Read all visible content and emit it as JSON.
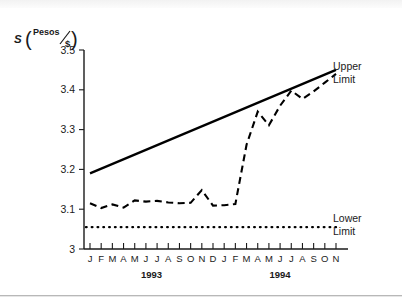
{
  "figure": {
    "background_color": "#ffffff",
    "ink_color": "#1a1a1a"
  },
  "axis_label": {
    "symbol": "S",
    "numerator": "Pesos",
    "denominator": "$",
    "paren_open": "(",
    "paren_close": ")",
    "slash": "/"
  },
  "chart_data": {
    "type": "line",
    "title": "",
    "subtitle": "",
    "xlabel": "",
    "ylabel": "S (Pesos/$)",
    "ylim": [
      3.0,
      3.5
    ],
    "yticks": [
      3.0,
      3.1,
      3.2,
      3.3,
      3.4,
      3.5
    ],
    "ytick_labels": [
      "3",
      "3.1",
      "3.2",
      "3.3",
      "3.4",
      "3.5"
    ],
    "grid": false,
    "legend_position": "inline-right-annotations",
    "x": [
      "1993-01",
      "1993-02",
      "1993-03",
      "1993-04",
      "1993-05",
      "1993-06",
      "1993-07",
      "1993-08",
      "1993-09",
      "1993-10",
      "1993-11",
      "1993-12",
      "1994-01",
      "1994-02",
      "1994-03",
      "1994-04",
      "1994-05",
      "1994-06",
      "1994-07",
      "1994-08",
      "1994-09",
      "1994-10",
      "1994-11"
    ],
    "xtick_labels": [
      "J",
      "F",
      "M",
      "A",
      "M",
      "J",
      "J",
      "A",
      "S",
      "O",
      "N",
      "D",
      "J",
      "F",
      "M",
      "A",
      "M",
      "J",
      "J",
      "A",
      "S",
      "O",
      "N"
    ],
    "year_groups": [
      {
        "label": "1993",
        "start_index": 0,
        "end_index": 11
      },
      {
        "label": "1994",
        "start_index": 12,
        "end_index": 22
      }
    ],
    "series": [
      {
        "name": "Exchange Rate",
        "style": "dashed",
        "color": "#000000",
        "values": [
          3.115,
          3.103,
          3.112,
          3.104,
          3.122,
          3.119,
          3.121,
          3.117,
          3.115,
          3.116,
          3.148,
          3.109,
          3.11,
          3.113,
          3.262,
          3.345,
          3.311,
          3.36,
          3.398,
          3.377,
          3.396,
          3.418,
          3.44
        ]
      },
      {
        "name": "Upper Limit",
        "style": "solid",
        "color": "#000000",
        "values": [
          3.19,
          3.202,
          3.214,
          3.226,
          3.238,
          3.249,
          3.261,
          3.273,
          3.285,
          3.297,
          3.308,
          3.32,
          3.332,
          3.344,
          3.356,
          3.367,
          3.379,
          3.391,
          3.403,
          3.415,
          3.426,
          3.438,
          3.45
        ]
      },
      {
        "name": "Lower Limit",
        "style": "dotted",
        "color": "#000000",
        "values": [
          3.055,
          3.055,
          3.055,
          3.055,
          3.055,
          3.055,
          3.055,
          3.055,
          3.055,
          3.055,
          3.055,
          3.055,
          3.055,
          3.055,
          3.055,
          3.055,
          3.055,
          3.055,
          3.055,
          3.055,
          3.055,
          3.055,
          3.055
        ]
      }
    ],
    "annotations": [
      {
        "name": "upper-limit-label",
        "line1": "Upper",
        "line2": "Limit"
      },
      {
        "name": "lower-limit-label",
        "line1": "Lower",
        "line2": "Limit"
      }
    ]
  }
}
